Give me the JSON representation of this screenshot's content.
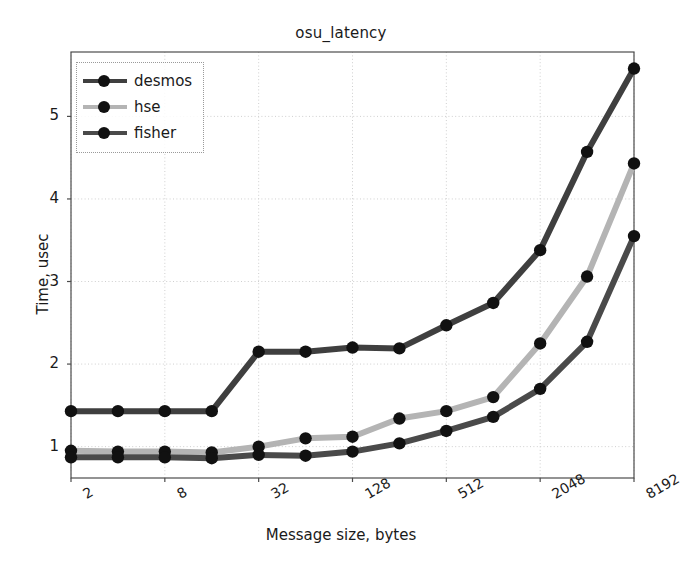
{
  "chart_data": {
    "type": "line",
    "title": "osu_latency",
    "xlabel": "Message size, bytes",
    "ylabel": "Time, usec",
    "xscale": "log2",
    "yscale": "linear",
    "grid": true,
    "legend_position": "upper left",
    "x": [
      2,
      4,
      8,
      16,
      32,
      64,
      128,
      256,
      512,
      1024,
      2048,
      4096,
      8192
    ],
    "xtick_labels": [
      "2",
      "8",
      "32",
      "128",
      "512",
      "2048",
      "8192"
    ],
    "xtick_values": [
      2,
      8,
      32,
      128,
      512,
      2048,
      8192
    ],
    "ytick_labels": [
      "1",
      "2",
      "3",
      "4",
      "5"
    ],
    "ytick_values": [
      1,
      2,
      3,
      4,
      5
    ],
    "xlim": [
      2,
      8192
    ],
    "ylim": [
      0.62,
      5.78
    ],
    "series": [
      {
        "name": "desmos",
        "color": "#3f3f3f",
        "values": [
          1.43,
          1.43,
          1.43,
          1.43,
          2.15,
          2.15,
          2.2,
          2.19,
          2.47,
          2.74,
          3.38,
          4.57,
          5.58
        ]
      },
      {
        "name": "hse",
        "color": "#b4b4b4",
        "values": [
          0.95,
          0.94,
          0.94,
          0.93,
          1.0,
          1.1,
          1.12,
          1.34,
          1.43,
          1.6,
          2.25,
          3.06,
          4.43
        ]
      },
      {
        "name": "fisher",
        "color": "#4a4a4a",
        "values": [
          0.87,
          0.87,
          0.87,
          0.86,
          0.9,
          0.89,
          0.94,
          1.04,
          1.19,
          1.36,
          1.7,
          2.27,
          3.55
        ]
      }
    ]
  },
  "legend": {
    "entries": [
      {
        "label": "desmos"
      },
      {
        "label": "hse"
      },
      {
        "label": "fisher"
      }
    ]
  },
  "style": {
    "marker_color": "#111111",
    "axis_color": "#4c4c4c",
    "grid_color": "#cfcfcf",
    "text_color": "#1a1a1a"
  }
}
